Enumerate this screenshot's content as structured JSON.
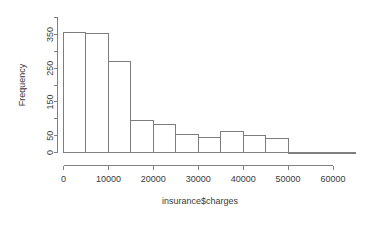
{
  "chart_data": {
    "type": "bar",
    "title": "",
    "subtitle": "",
    "xlabel": "insurance$charges",
    "ylabel": "Frequency",
    "grid": false,
    "legend": false,
    "bin_width": 5000,
    "xlim": [
      0,
      65000
    ],
    "ylim": [
      0,
      400
    ],
    "x_ticks": [
      0,
      10000,
      20000,
      30000,
      40000,
      50000,
      60000
    ],
    "x_tick_labels": [
      "0",
      "10000",
      "20000",
      "30000",
      "40000",
      "50000",
      "60000"
    ],
    "y_ticks": [
      0,
      50,
      100,
      150,
      200,
      250,
      300,
      350,
      400
    ],
    "y_tick_labels": [
      "0",
      "50",
      "",
      "150",
      "",
      "250",
      "",
      "350",
      ""
    ],
    "bins": [
      {
        "start": 0,
        "end": 5000,
        "count": 355
      },
      {
        "start": 5000,
        "end": 10000,
        "count": 352
      },
      {
        "start": 10000,
        "end": 15000,
        "count": 270
      },
      {
        "start": 15000,
        "end": 20000,
        "count": 96
      },
      {
        "start": 20000,
        "end": 25000,
        "count": 84
      },
      {
        "start": 25000,
        "end": 30000,
        "count": 52
      },
      {
        "start": 30000,
        "end": 35000,
        "count": 44
      },
      {
        "start": 35000,
        "end": 40000,
        "count": 62
      },
      {
        "start": 40000,
        "end": 45000,
        "count": 50
      },
      {
        "start": 45000,
        "end": 50000,
        "count": 42
      },
      {
        "start": 50000,
        "end": 55000,
        "count": 0
      },
      {
        "start": 55000,
        "end": 60000,
        "count": 0
      },
      {
        "start": 60000,
        "end": 65000,
        "count": 0
      }
    ],
    "categories": [
      "0-5000",
      "5000-10000",
      "10000-15000",
      "15000-20000",
      "20000-25000",
      "25000-30000",
      "30000-35000",
      "35000-40000",
      "40000-45000",
      "45000-50000",
      "50000-55000",
      "55000-60000",
      "60000-65000"
    ],
    "values": [
      355,
      352,
      270,
      96,
      84,
      52,
      44,
      62,
      50,
      42,
      0,
      0,
      0
    ]
  }
}
